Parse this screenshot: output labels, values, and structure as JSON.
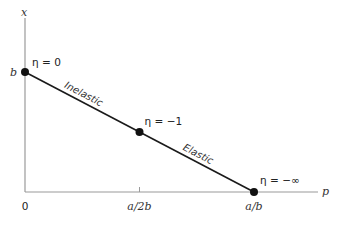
{
  "chart_data": {
    "type": "line",
    "title": "",
    "xlabel": "p",
    "ylabel": "x",
    "x_ticks": [
      {
        "value": 0,
        "label": "0"
      },
      {
        "value": 0.5,
        "label": "a/2b"
      },
      {
        "value": 1,
        "label": "a/b"
      }
    ],
    "y_ticks": [
      {
        "value": 1,
        "label": "b"
      }
    ],
    "series": [
      {
        "name": "demand",
        "x": [
          0,
          1
        ],
        "y": [
          1,
          0
        ]
      }
    ],
    "points": [
      {
        "x": 0,
        "y": 1,
        "annotation": "η = 0"
      },
      {
        "x": 0.5,
        "y": 0.5,
        "annotation": "η = −1"
      },
      {
        "x": 1,
        "y": 0,
        "annotation": "η = −∞"
      }
    ],
    "regions": [
      {
        "label": "Inelastic",
        "at_x": 0.25
      },
      {
        "label": "Elastic",
        "at_x": 0.75
      }
    ],
    "xlim": [
      0,
      1.25
    ],
    "ylim": [
      0,
      1.45
    ],
    "grid": false,
    "legend": "none"
  }
}
